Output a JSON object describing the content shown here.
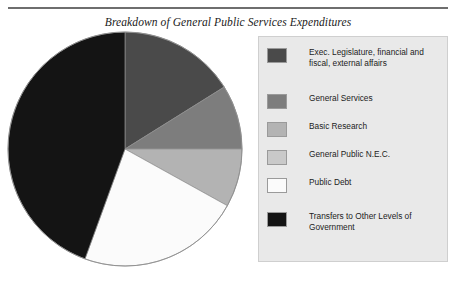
{
  "title": "Breakdown of General Public Services Expenditures",
  "rules": {
    "top_label": "top-divider",
    "bottom_label": "bottom-divider"
  },
  "legend": {
    "items": [
      {
        "label": "Exec. Legislature, financial and fiscal, external affairs",
        "color": "#4a4a4a"
      },
      {
        "label": "General Services",
        "color": "#7d7d7d"
      },
      {
        "label": "Basic Research",
        "color": "#b3b3b3"
      },
      {
        "label": "General Public N.E.C.",
        "color": "#c9c9c9"
      },
      {
        "label": "Public Debt",
        "color": "#fbfbfb"
      },
      {
        "label": "Transfers to Other Levels of Government",
        "color": "#141414"
      }
    ]
  },
  "chart_data": {
    "type": "pie",
    "title": "Breakdown of General Public Services Expenditures",
    "xlabel": "",
    "ylabel": "",
    "legend_position": "right",
    "grid": false,
    "start_angle_deg": 0,
    "direction": "clockwise",
    "categories": [
      "Exec. Legislature, financial and fiscal, external affairs",
      "General Services",
      "Basic Research",
      "General Public N.E.C.",
      "Public Debt",
      "Transfers to Other Levels of Government"
    ],
    "values": [
      16.1,
      8.9,
      8.1,
      0.0,
      22.5,
      44.4
    ],
    "angles_deg": [
      58,
      32,
      29,
      0,
      81,
      160
    ],
    "colors": [
      "#4a4a4a",
      "#7d7d7d",
      "#b3b3b3",
      "#c9c9c9",
      "#fbfbfb",
      "#141414"
    ],
    "units": "percent"
  },
  "geometry": {
    "center_x": 119,
    "center_y": 119,
    "radius": 117
  }
}
